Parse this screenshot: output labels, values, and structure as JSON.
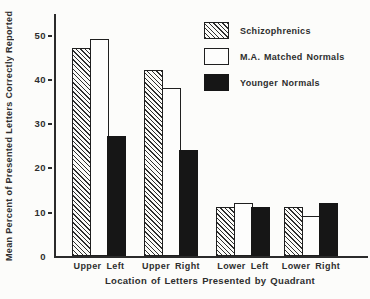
{
  "figure": {
    "background": "#fcfcfa",
    "ink_color": "#2b2b2b"
  },
  "chart_data": {
    "type": "bar",
    "title": "",
    "categories": [
      "Upper Left",
      "Upper Right",
      "Lower Left",
      "Lower Right"
    ],
    "series": [
      {
        "name": "Schizophrenics",
        "swatch": "hatched",
        "values": [
          47,
          42,
          11,
          11
        ]
      },
      {
        "name": "M.A. Matched Normals",
        "swatch": "white",
        "values": [
          49,
          38,
          12,
          9
        ]
      },
      {
        "name": "Younger Normals",
        "swatch": "black",
        "values": [
          27,
          24,
          11,
          12
        ]
      }
    ],
    "xlabel": "Location of Letters Presented by Quadrant",
    "ylabel": "Mean Percent of Presented Letters Correctly Reported",
    "ylim": [
      0,
      55
    ],
    "yticks": [
      0,
      10,
      20,
      30,
      40,
      50
    ],
    "legend_position": "top-right",
    "grid": false
  }
}
